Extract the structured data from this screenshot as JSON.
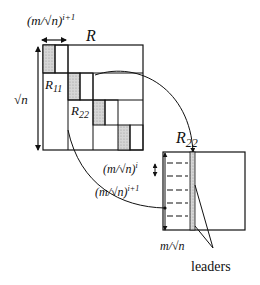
{
  "diagram": {
    "matrix_label": "R",
    "side_label": "√n",
    "block_width_label": "(m/√n)",
    "block_width_exp": "i+1",
    "block_labels": {
      "r11": "R",
      "r11_sub": "11",
      "r22": "R",
      "r22_sub": "22"
    },
    "zoom_matrix_label": "R",
    "zoom_matrix_sub": "22",
    "row_block_label": "(m/√n)",
    "row_block_exp": "i",
    "row_group_label": "(m/√n)",
    "row_group_exp": "i+1",
    "column_height_label": "m/√n",
    "leaders_label": "leaders",
    "colors": {
      "stroke": "#111111",
      "shade": "#c8c8c8",
      "background": "#ffffff"
    }
  }
}
